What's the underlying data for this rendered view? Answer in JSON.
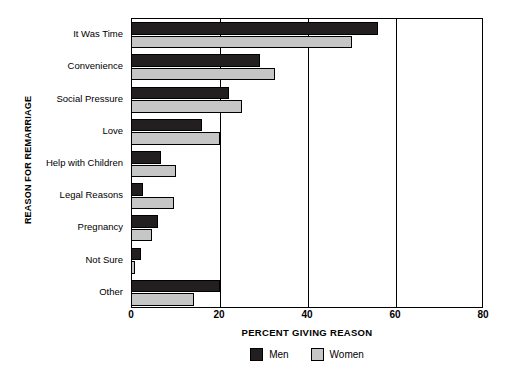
{
  "chart_data": {
    "type": "bar",
    "orientation": "horizontal",
    "title": "",
    "xlabel": "PERCENT GIVING REASON",
    "ylabel": "REASON FOR REMARRIAGE",
    "categories": [
      "It Was Time",
      "Convenience",
      "Social Pressure",
      "Love",
      "Help with Children",
      "Legal Reasons",
      "Pregnancy",
      "Not Sure",
      "Other"
    ],
    "series": [
      {
        "name": "Men",
        "color": "#231f20",
        "values": [
          56,
          29,
          22,
          16,
          6.5,
          2.5,
          6,
          2,
          20
        ]
      },
      {
        "name": "Women",
        "color": "#c6c6c6",
        "values": [
          50,
          32.5,
          25,
          20,
          10,
          9.5,
          4.5,
          0.7,
          14
        ]
      }
    ],
    "xlim": [
      0,
      80
    ],
    "xticks": [
      0,
      20,
      40,
      60,
      80
    ],
    "xtick_labels": [
      "0",
      "20",
      "40",
      "60",
      "80"
    ],
    "grid": "vertical-at-xticks",
    "legend_position": "bottom-center",
    "legend_entries": [
      "Men",
      "Women"
    ]
  }
}
